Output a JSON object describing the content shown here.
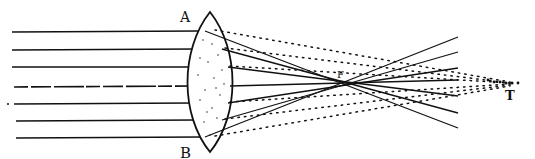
{
  "diagram": {
    "labels": {
      "lens_top": "A",
      "lens_bottom": "B",
      "focus": "F",
      "far_point": "T"
    },
    "colors": {
      "ink": "#111111",
      "background": "#ffffff"
    },
    "incoming_rays_y": [
      32,
      50,
      67,
      87,
      104,
      121,
      138
    ],
    "lens": {
      "x_left": 190,
      "x_right": 232,
      "y_top": 12,
      "y_bottom": 152
    },
    "focus_point": {
      "x": 345,
      "y": 82
    },
    "far_point": {
      "x": 510,
      "y": 84
    }
  }
}
